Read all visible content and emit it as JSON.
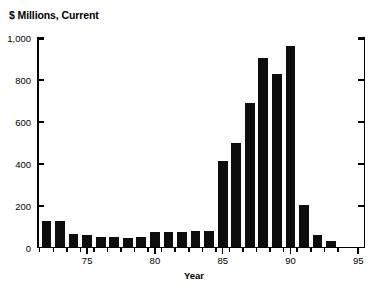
{
  "chart_data": {
    "type": "bar",
    "title": "$ Millions, Current",
    "xlabel": "Year",
    "ylabel": "",
    "ylim": [
      0,
      1000
    ],
    "xlim": [
      71.3,
      95.5
    ],
    "grid": false,
    "legend": "none",
    "y_ticks": [
      "0",
      "200",
      "400",
      "600",
      "800",
      "1,000"
    ],
    "y_tick_values": [
      0,
      200,
      400,
      600,
      800,
      1000
    ],
    "x_ticks": [
      "75",
      "80",
      "85",
      "90",
      "95"
    ],
    "x_tick_values": [
      75,
      80,
      85,
      90,
      95
    ],
    "categories": [
      72,
      73,
      74,
      75,
      76,
      77,
      78,
      79,
      80,
      81,
      82,
      83,
      84,
      85,
      86,
      87,
      88,
      89,
      90,
      91,
      92,
      93
    ],
    "values": [
      120,
      122,
      58,
      55,
      45,
      43,
      42,
      45,
      68,
      70,
      68,
      72,
      75,
      405,
      495,
      685,
      900,
      820,
      955,
      200,
      55,
      25
    ],
    "bar_color": "#0d0d0d"
  }
}
